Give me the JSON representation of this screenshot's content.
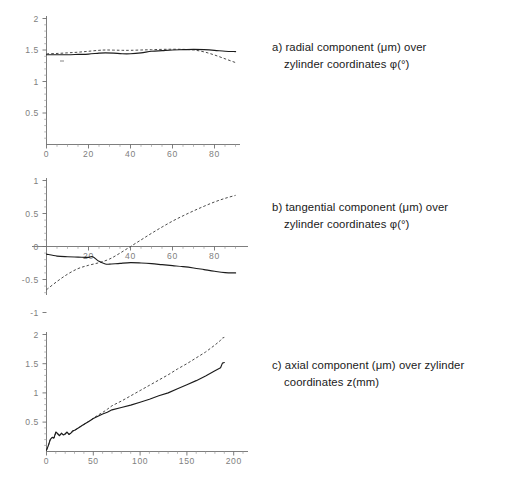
{
  "figure": {
    "background": "#ffffff",
    "axis_color": "#6f6f6f",
    "tick_label_color": "#808080",
    "solid_series_color": "#1c1c1c",
    "dashed_series_color": "#4a4a4a"
  },
  "panels": [
    {
      "id": "a",
      "caption_line1": "a) radial component (μm) over",
      "caption_line2": "zylinder coordinates φ(°)"
    },
    {
      "id": "b",
      "caption_line1": "b) tangential component (μm) over",
      "caption_line2": "zylinder coordinates φ(°)"
    },
    {
      "id": "c",
      "caption_line1": "c) axial component (μm) over zylinder",
      "caption_line2": "coordinates z(mm)"
    }
  ],
  "chart_data": [
    {
      "type": "line",
      "title": "a) radial component (μm) over zylinder coordinates φ(°)",
      "xlabel": "φ (°)",
      "ylabel": "radial component (μm)",
      "xlim": [
        0,
        92
      ],
      "ylim": [
        0,
        2.1
      ],
      "xticks": [
        0,
        20,
        40,
        60,
        80
      ],
      "xtick_labels": [
        "0",
        "20",
        "40",
        "60",
        "80"
      ],
      "yticks": [
        0.5,
        1,
        1.5,
        2
      ],
      "ytick_labels": [
        "0.5",
        "1",
        "1.5",
        "2"
      ],
      "x_minor_step": 5,
      "y_minor_step": 0.1,
      "grid": false,
      "legend": null,
      "series": [
        {
          "name": "measured",
          "style": "solid",
          "x": [
            0,
            5,
            10,
            15,
            20,
            25,
            28,
            32,
            36,
            40,
            45,
            50,
            55,
            60,
            65,
            70,
            75,
            80,
            85,
            90
          ],
          "y": [
            1.425,
            1.425,
            1.425,
            1.43,
            1.435,
            1.45,
            1.455,
            1.45,
            1.44,
            1.44,
            1.455,
            1.48,
            1.49,
            1.5,
            1.505,
            1.51,
            1.505,
            1.495,
            1.48,
            1.475
          ]
        },
        {
          "name": "simulated",
          "style": "dashed",
          "x": [
            0,
            5,
            10,
            15,
            20,
            25,
            28,
            32,
            36,
            40,
            45,
            50,
            55,
            60,
            65,
            70,
            75,
            80,
            85,
            90
          ],
          "y": [
            1.44,
            1.445,
            1.455,
            1.465,
            1.48,
            1.495,
            1.5,
            1.498,
            1.495,
            1.495,
            1.5,
            1.505,
            1.51,
            1.512,
            1.51,
            1.5,
            1.47,
            1.42,
            1.36,
            1.3
          ]
        }
      ]
    },
    {
      "type": "line",
      "title": "b) tangential component (μm) over zylinder coordinates φ(°)",
      "xlabel": "φ (°)",
      "ylabel": "tangential component (μm)",
      "xlim": [
        0,
        92
      ],
      "ylim": [
        -1.05,
        1.05
      ],
      "xticks": [
        20,
        40,
        60,
        80
      ],
      "xtick_labels": [
        "20",
        "40",
        "60",
        "80"
      ],
      "yticks": [
        -1,
        -0.5,
        0,
        0.5,
        1
      ],
      "ytick_labels": [
        "-1",
        "-0.5",
        "0",
        "0.5",
        "1"
      ],
      "x_minor_step": 5,
      "y_minor_step": 0.1,
      "grid": false,
      "legend": null,
      "series": [
        {
          "name": "measured",
          "style": "solid",
          "x": [
            0,
            5,
            10,
            15,
            20,
            22,
            25,
            28,
            30,
            35,
            40,
            45,
            50,
            55,
            60,
            65,
            70,
            75,
            80,
            85,
            90
          ],
          "y": [
            -0.115,
            -0.145,
            -0.155,
            -0.16,
            -0.165,
            -0.155,
            -0.225,
            -0.265,
            -0.268,
            -0.255,
            -0.245,
            -0.25,
            -0.26,
            -0.275,
            -0.29,
            -0.305,
            -0.325,
            -0.35,
            -0.375,
            -0.395,
            -0.4
          ]
        },
        {
          "name": "simulated",
          "style": "dashed",
          "x": [
            0,
            5,
            10,
            15,
            20,
            25,
            30,
            35,
            40,
            45,
            50,
            55,
            60,
            65,
            70,
            75,
            80,
            85,
            90
          ],
          "y": [
            -0.655,
            -0.53,
            -0.42,
            -0.335,
            -0.285,
            -0.245,
            -0.19,
            -0.1,
            0.0,
            0.1,
            0.2,
            0.295,
            0.385,
            0.465,
            0.54,
            0.61,
            0.675,
            0.73,
            0.775
          ]
        }
      ]
    },
    {
      "type": "line",
      "title": "c) axial component (μm) over zylinder coordinates z(mm)",
      "xlabel": "z (mm)",
      "ylabel": "axial component (μm)",
      "xlim": [
        0,
        215
      ],
      "ylim": [
        0,
        2.15
      ],
      "xticks": [
        0,
        50,
        100,
        150,
        200
      ],
      "xtick_labels": [
        "0",
        "50",
        "100",
        "150",
        "200"
      ],
      "yticks": [
        0.5,
        1,
        1.5,
        2
      ],
      "ytick_labels": [
        "0.5",
        "1",
        "1.5",
        "2"
      ],
      "x_minor_step": 10,
      "y_minor_step": 0.1,
      "grid": false,
      "legend": null,
      "series": [
        {
          "name": "measured",
          "style": "solid",
          "x": [
            0,
            2,
            4,
            6,
            8,
            10,
            12,
            14,
            16,
            18,
            20,
            22,
            24,
            26,
            28,
            30,
            34,
            38,
            42,
            46,
            50,
            55,
            60,
            65,
            70,
            80,
            90,
            100,
            110,
            120,
            130,
            140,
            150,
            160,
            170,
            180,
            186,
            188,
            190
          ],
          "y": [
            0.02,
            0.1,
            0.2,
            0.24,
            0.23,
            0.33,
            0.3,
            0.27,
            0.31,
            0.28,
            0.3,
            0.33,
            0.29,
            0.31,
            0.35,
            0.36,
            0.4,
            0.44,
            0.48,
            0.52,
            0.56,
            0.6,
            0.64,
            0.67,
            0.71,
            0.75,
            0.79,
            0.84,
            0.89,
            0.95,
            1.0,
            1.07,
            1.14,
            1.21,
            1.29,
            1.38,
            1.43,
            1.51,
            1.52
          ]
        },
        {
          "name": "simulated",
          "style": "dashed",
          "x": [
            0,
            2,
            4,
            6,
            8,
            10,
            12,
            14,
            16,
            18,
            20,
            22,
            24,
            26,
            28,
            30,
            34,
            38,
            42,
            46,
            50,
            55,
            60,
            65,
            70,
            80,
            90,
            100,
            110,
            120,
            130,
            140,
            150,
            160,
            170,
            180,
            186,
            188,
            190
          ],
          "y": [
            0.02,
            0.1,
            0.2,
            0.23,
            0.225,
            0.32,
            0.29,
            0.265,
            0.3,
            0.275,
            0.29,
            0.32,
            0.285,
            0.3,
            0.34,
            0.355,
            0.4,
            0.44,
            0.48,
            0.52,
            0.565,
            0.62,
            0.665,
            0.72,
            0.78,
            0.86,
            0.95,
            1.04,
            1.13,
            1.22,
            1.31,
            1.41,
            1.5,
            1.6,
            1.7,
            1.82,
            1.9,
            1.94,
            1.95
          ]
        }
      ]
    }
  ]
}
